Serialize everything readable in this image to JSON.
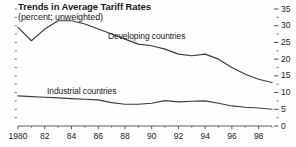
{
  "chart_data": {
    "type": "line",
    "title": "Trends in Average Tariff Rates",
    "subtitle": "(percent; unweighted)",
    "xlabel": "",
    "ylabel": "",
    "ylim": [
      0,
      35
    ],
    "xlim": [
      1980,
      1999
    ],
    "ytick_side": "right",
    "yticks": [
      0,
      5,
      10,
      15,
      20,
      25,
      30,
      35
    ],
    "ytick_labels": [
      "0",
      "5",
      "10",
      "15",
      "20",
      "25",
      "30",
      "35"
    ],
    "yminor_step": 2.5,
    "xticks": [
      1980,
      1982,
      1984,
      1986,
      1988,
      1990,
      1992,
      1994,
      1996,
      1998
    ],
    "xtick_labels": [
      "1980",
      "82",
      "84",
      "86",
      "88",
      "90",
      "92",
      "94",
      "96",
      "98"
    ],
    "xminor_step": 1,
    "grid": false,
    "legend_position": "inline-annotation",
    "x": [
      1980,
      1981,
      1982,
      1983,
      1984,
      1985,
      1986,
      1987,
      1988,
      1989,
      1990,
      1991,
      1992,
      1993,
      1994,
      1995,
      1996,
      1997,
      1998,
      1999
    ],
    "series": [
      {
        "name": "Developing countries",
        "color": "#3c3c3c",
        "values": [
          29.5,
          25.5,
          29.0,
          31.5,
          31.5,
          30.5,
          29.0,
          27.5,
          26.0,
          24.5,
          24.0,
          23.0,
          21.5,
          21.0,
          21.5,
          20.0,
          17.5,
          15.5,
          14.0,
          13.0
        ]
      },
      {
        "name": "Industrial countries",
        "color": "#3c3c3c",
        "values": [
          9.0,
          8.8,
          8.6,
          8.4,
          8.2,
          8.0,
          7.8,
          7.0,
          6.5,
          6.5,
          6.8,
          7.6,
          7.2,
          7.4,
          7.5,
          6.8,
          6.0,
          5.6,
          5.4,
          5.0
        ]
      }
    ],
    "annotations": [
      {
        "text": "Developing countries",
        "x": 1987.0,
        "y": 29.0
      },
      {
        "text": "Industrial countries",
        "x": 1982.5,
        "y": 12.5
      }
    ]
  },
  "style": {
    "axis_color": "#4a4a4a",
    "line_color": "#3c3c3c",
    "text_color": "#1b1b1b",
    "background": "#fefefe"
  }
}
